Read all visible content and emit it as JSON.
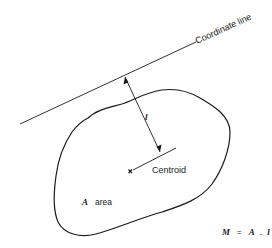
{
  "diagram": {
    "coordinate_line_label": "Coordinate line",
    "distance_label": "l",
    "centroid_label": "Centroid",
    "area_symbol": "A",
    "area_label": "area",
    "formula": {
      "lhs": "M",
      "eq": "=",
      "a": "A",
      "dot": ".",
      "l": "l"
    },
    "stroke_color": "#1a1a1a"
  }
}
